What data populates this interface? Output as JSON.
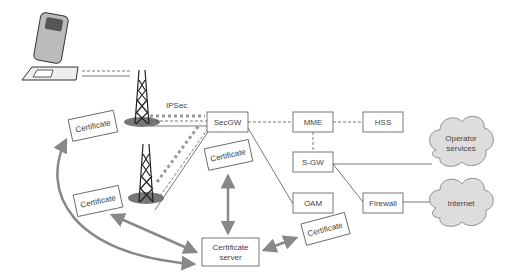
{
  "diagram": {
    "labels": {
      "ipsec": "IPSec",
      "secgw": "SecGW",
      "mme": "MME",
      "hss": "HSS",
      "sgw": "S-GW",
      "oam": "OAM",
      "firewall": "Firewall",
      "cert_server_line1": "Certificate",
      "cert_server_line2": "server",
      "operator_line1": "Operator",
      "operator_line2": "services",
      "internet": "Internet",
      "certificate": "Certificate"
    },
    "colors": {
      "line": "#555555",
      "arrow": "#888888",
      "ipsec_dots": "#999999",
      "cloud": "#dddddd"
    }
  }
}
